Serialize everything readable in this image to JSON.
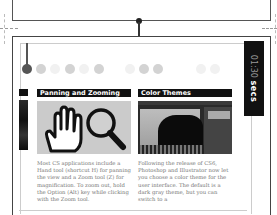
{
  "timer": {
    "time": "01:30",
    "unit": "secs"
  },
  "timeline": {
    "dots": [
      {
        "state": "active"
      },
      {
        "state": "mid"
      },
      {
        "state": "faint"
      },
      {
        "state": "mid"
      },
      {
        "state": "faint"
      },
      {
        "state": "mid"
      },
      {
        "state": "faint"
      },
      {
        "state": "mid"
      },
      {
        "state": "mid"
      },
      {
        "state": "faint"
      },
      {
        "state": "faint"
      }
    ]
  },
  "cards": [
    {
      "title": "Panning and Zooming",
      "image": "hand-and-magnifier-icons",
      "text": "Most CS applications include a Hand tool (shortcut H) for panning the view and a Zoom tool (Z) for magnification. To zoom out, hold the Option (Alt) key while clicking with the Zoom tool."
    },
    {
      "title": "Color Themes",
      "image": "dark-ui-screenshot",
      "text": "Following the release of CS6, Photoshop and Illustrator now let you choose a color theme for the user interface. The default is a dark gray theme, but you can switch to a"
    }
  ]
}
